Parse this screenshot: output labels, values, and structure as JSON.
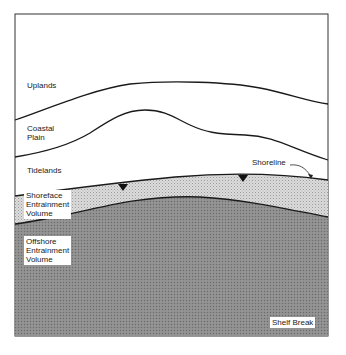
{
  "diagram": {
    "type": "cross-section",
    "zones": [
      {
        "id": "uplands",
        "label": "Uplands"
      },
      {
        "id": "coastal_plain",
        "label_lines": [
          "Coastal",
          "Plain"
        ]
      },
      {
        "id": "tidelands",
        "label": "Tidelands"
      },
      {
        "id": "shoreface",
        "label_lines": [
          "Shoreface",
          "Entrainment",
          "Volume"
        ]
      },
      {
        "id": "offshore",
        "label_lines": [
          "Offshore",
          "Entrainment",
          "Volume"
        ]
      }
    ],
    "annotations": {
      "shoreline": "Shoreline",
      "shelf_break": "Shelf Break"
    },
    "colors": {
      "shoreface_fill": "#d6d6d6",
      "offshore_fill": "#8c8c8c",
      "line": "#1a1a1a",
      "background": "#ffffff"
    }
  }
}
